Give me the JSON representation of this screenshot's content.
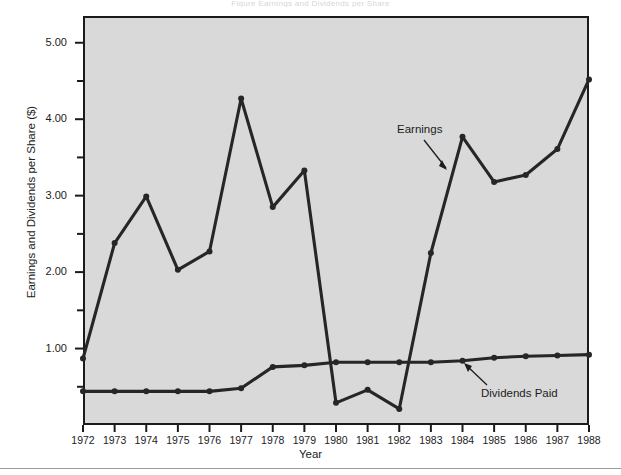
{
  "figure": {
    "title_strip": "Figure  Earnings and Dividends per Share",
    "annotations": {
      "earnings": "Earnings",
      "dividends": "Dividends Paid"
    }
  },
  "chart_data": {
    "type": "line",
    "title": "",
    "xlabel": "Year",
    "ylabel": "Earnings and Dividends per Share ($)",
    "x": [
      1972,
      1973,
      1974,
      1975,
      1976,
      1977,
      1978,
      1979,
      1980,
      1981,
      1982,
      1983,
      1984,
      1985,
      1986,
      1987,
      1988
    ],
    "categories": [
      "1972",
      "1973",
      "1974",
      "1975",
      "1976",
      "1977",
      "1978",
      "1979",
      "1980",
      "1981",
      "1982",
      "1983",
      "1984",
      "1985",
      "1986",
      "1987",
      "1988"
    ],
    "xlim": [
      1972,
      1988
    ],
    "ylim": [
      0.0,
      5.35
    ],
    "y_major_ticks": [
      1.0,
      2.0,
      3.0,
      4.0,
      5.0
    ],
    "y_major_tick_labels": [
      "1.00",
      "2.00",
      "3.00",
      "4.00",
      "5.00"
    ],
    "y_minor_ticks": [
      0.5,
      1.5,
      2.5,
      3.5,
      4.5
    ],
    "grid": false,
    "legend": "inline-annotations",
    "colors": {
      "line": "#262626",
      "plot_background": "#d9d9d9",
      "axis": "#1b1b1b",
      "text": "#1c1c1c",
      "page_background": "#ffffff"
    },
    "series": [
      {
        "name": "Earnings",
        "values": [
          0.87,
          2.38,
          2.99,
          2.03,
          2.27,
          4.27,
          2.85,
          3.33,
          0.29,
          0.46,
          0.21,
          2.25,
          3.77,
          3.18,
          3.27,
          3.61,
          4.52
        ]
      },
      {
        "name": "Dividends Paid",
        "values": [
          0.44,
          0.44,
          0.44,
          0.44,
          0.44,
          0.48,
          0.76,
          0.78,
          0.82,
          0.82,
          0.82,
          0.82,
          0.84,
          0.88,
          0.9,
          0.91,
          0.92
        ]
      }
    ]
  }
}
